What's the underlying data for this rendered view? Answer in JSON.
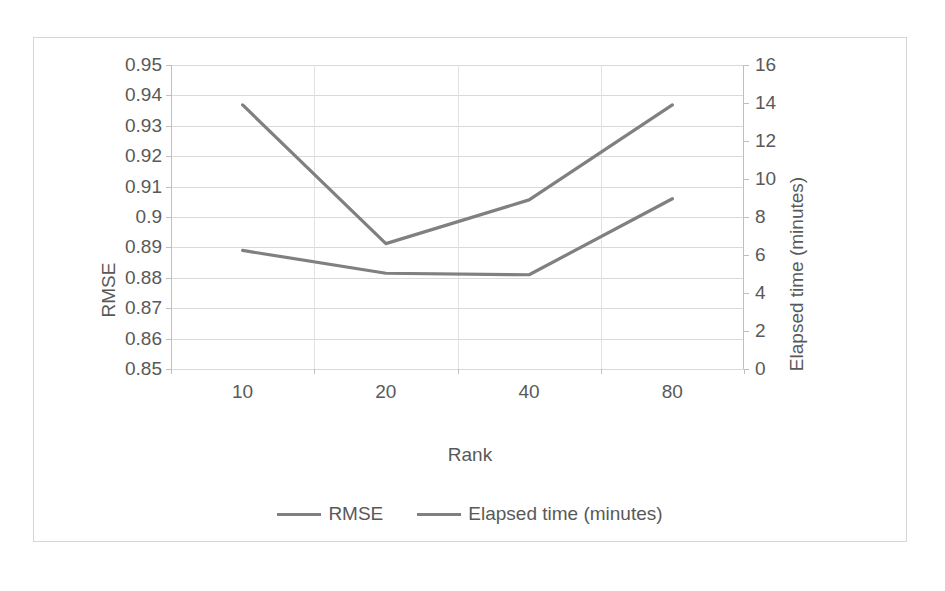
{
  "chart_data": {
    "type": "line",
    "title": "",
    "xlabel": "Rank",
    "categories": [
      "10",
      "20",
      "40",
      "80"
    ],
    "grid": true,
    "legend_position": "bottom",
    "axes": {
      "left": {
        "label": "RMSE",
        "ticks": [
          "0.95",
          "0.94",
          "0.93",
          "0.92",
          "0.91",
          "0.9",
          "0.89",
          "0.88",
          "0.87",
          "0.86",
          "0.85"
        ],
        "min": 0.85,
        "max": 0.95,
        "step": 0.01
      },
      "right": {
        "label": "Elapsed time (minutes)",
        "ticks": [
          "16",
          "14",
          "12",
          "10",
          "8",
          "6",
          "4",
          "2",
          "0"
        ],
        "min": 0,
        "max": 16,
        "step": 2
      }
    },
    "series": [
      {
        "name": "RMSE",
        "axis": "left",
        "color": "#808080",
        "values": [
          0.889,
          0.8815,
          0.881,
          0.906
        ]
      },
      {
        "name": "Elapsed time (minutes)",
        "axis": "right",
        "color": "#808080",
        "values": [
          13.9,
          6.6,
          8.9,
          13.9
        ]
      }
    ]
  },
  "legend": {
    "entries": [
      {
        "label": "RMSE"
      },
      {
        "label": "Elapsed time (minutes)"
      }
    ]
  },
  "colors": {
    "series_line": "#808080",
    "gridline": "#d9d9d9",
    "axis": "#bfbfbf",
    "text": "#595959",
    "frame": "#d6d6d6",
    "background": "#ffffff"
  }
}
